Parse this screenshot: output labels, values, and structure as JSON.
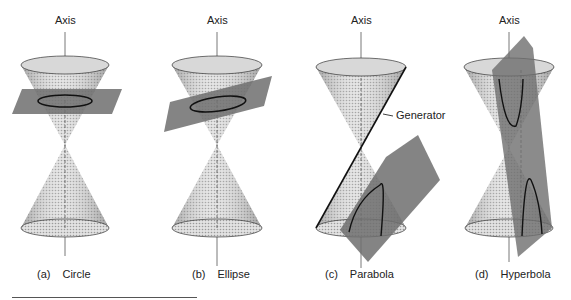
{
  "figure": {
    "panels": [
      {
        "id": "a",
        "axis_label": "Axis",
        "letter": "(a)",
        "name": "Circle"
      },
      {
        "id": "b",
        "axis_label": "Axis",
        "letter": "(b)",
        "name": "Ellipse"
      },
      {
        "id": "c",
        "axis_label": "Axis",
        "letter": "(c)",
        "name": "Parabola",
        "annotation": "Generator"
      },
      {
        "id": "d",
        "axis_label": "Axis",
        "letter": "(d)",
        "name": "Hyperbola"
      }
    ],
    "colors": {
      "cone_fill": "#c8c8c8",
      "cone_dark": "#8a8a8a",
      "plane": "#6e6e6e",
      "line": "#1a1a1a",
      "axis": "#555555"
    }
  }
}
